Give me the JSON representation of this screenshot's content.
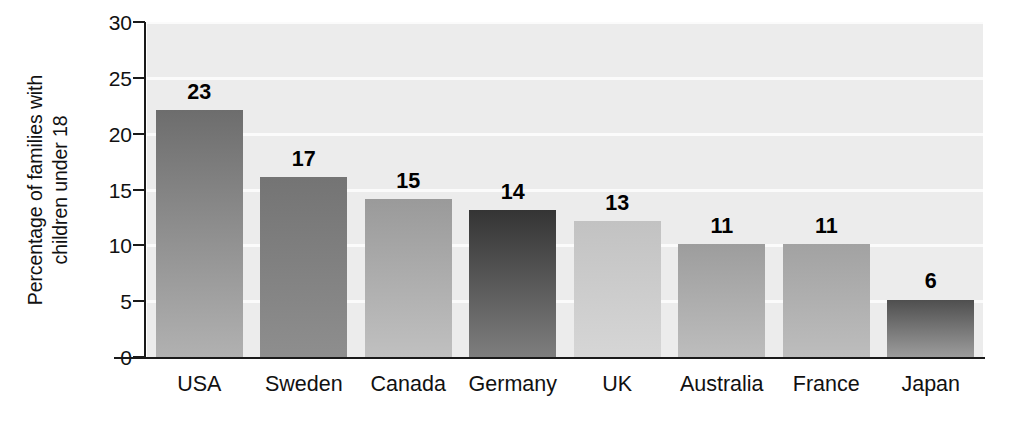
{
  "chart_data": {
    "type": "bar",
    "title": "",
    "xlabel": "",
    "ylabel": "Percentage of families with children under 18",
    "ylabel_line1": "Percentage of families with",
    "ylabel_line2": "children under 18",
    "categories": [
      "USA",
      "Sweden",
      "Canada",
      "Germany",
      "UK",
      "Australia",
      "France",
      "Japan"
    ],
    "values": [
      23,
      17,
      15,
      14,
      13,
      11,
      11,
      6
    ],
    "value_labels": [
      "23",
      "17",
      "15",
      "14",
      "13",
      "11",
      "11",
      "6"
    ],
    "ylim": [
      0,
      30
    ],
    "yticks": [
      0,
      5,
      10,
      15,
      20,
      25,
      30
    ],
    "ytick_labels": [
      "0",
      "5",
      "10",
      "15",
      "20",
      "25",
      "30"
    ],
    "grid": true,
    "legend": "none",
    "plot_background": "#ececec",
    "gridline_color": "#fbfbfb",
    "axis_color": "#1a1a1a",
    "bar_colors_top": [
      "#6d6d6d",
      "#747474",
      "#9a9a9a",
      "#343434",
      "#c2c2c2",
      "#9d9d9d",
      "#a2a2a2",
      "#4f4f4f"
    ],
    "bar_colors_bottom": [
      "#b1b1b1",
      "#8e8e8e",
      "#c0c0c0",
      "#7e7e7e",
      "#d6d6d6",
      "#bdbdbd",
      "#bdbdbd",
      "#9c9c9c"
    ]
  }
}
